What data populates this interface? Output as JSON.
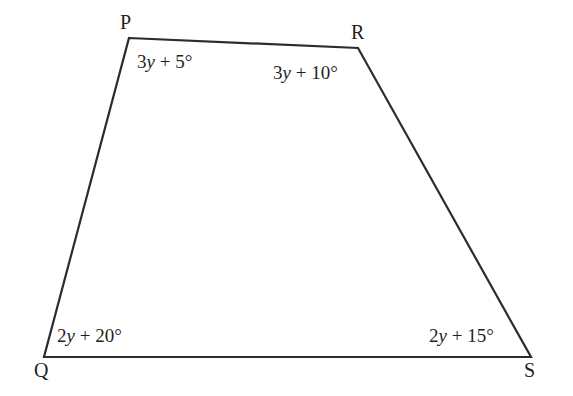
{
  "figure": {
    "shape": "quadrilateral",
    "stroke_color": "#2b2b30",
    "background_color": "#ffffff",
    "stroke_width": 2.2,
    "vertices": [
      {
        "name": "P",
        "label": "P",
        "x": 129,
        "y": 38,
        "label_x": 120,
        "label_y": 12
      },
      {
        "name": "R",
        "label": "R",
        "x": 358,
        "y": 48,
        "label_x": 351,
        "label_y": 22
      },
      {
        "name": "S",
        "label": "S",
        "x": 531,
        "y": 357,
        "label_x": 524,
        "label_y": 360
      },
      {
        "name": "Q",
        "label": "Q",
        "x": 44,
        "y": 357,
        "label_x": 34,
        "label_y": 360
      }
    ],
    "angles": [
      {
        "at_vertex": "P",
        "coefficient": "3",
        "variable": "y",
        "operator": "+",
        "constant": "5",
        "unit": "°",
        "prefix": "3",
        "suffix": " + 5°",
        "x": 137,
        "y": 52
      },
      {
        "at_vertex": "R",
        "coefficient": "3",
        "variable": "y",
        "operator": "+",
        "constant": "10",
        "unit": "°",
        "prefix": "3",
        "suffix": " + 10°",
        "x": 273,
        "y": 63
      },
      {
        "at_vertex": "Q",
        "coefficient": "2",
        "variable": "y",
        "operator": "+",
        "constant": "20",
        "unit": "°",
        "prefix": "2",
        "suffix": " + 20°",
        "x": 57,
        "y": 326
      },
      {
        "at_vertex": "S",
        "coefficient": "2",
        "variable": "y",
        "operator": "+",
        "constant": "15",
        "unit": "°",
        "prefix": "2",
        "suffix": " + 15°",
        "x": 429,
        "y": 326
      }
    ],
    "edges": [
      {
        "name": "edge-P-R",
        "from": "P",
        "to": "R"
      },
      {
        "name": "edge-R-S",
        "from": "R",
        "to": "S"
      },
      {
        "name": "edge-S-Q",
        "from": "S",
        "to": "Q"
      },
      {
        "name": "edge-Q-P",
        "from": "Q",
        "to": "P"
      }
    ]
  }
}
